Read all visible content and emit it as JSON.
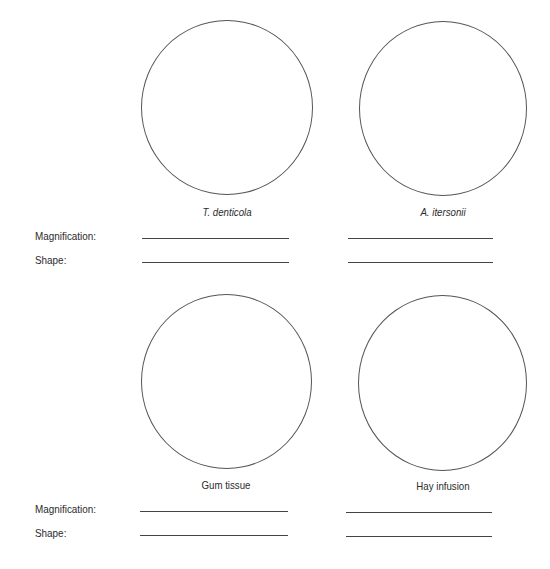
{
  "specimens": [
    {
      "label": "T. denticola",
      "italic": true
    },
    {
      "label": "A. itersonii",
      "italic": true
    },
    {
      "label": "Gum tissue",
      "italic": false
    },
    {
      "label": "Hay infusion",
      "italic": false
    }
  ],
  "fields": {
    "magnification_label": "Magnification:",
    "shape_label": "Shape:"
  }
}
